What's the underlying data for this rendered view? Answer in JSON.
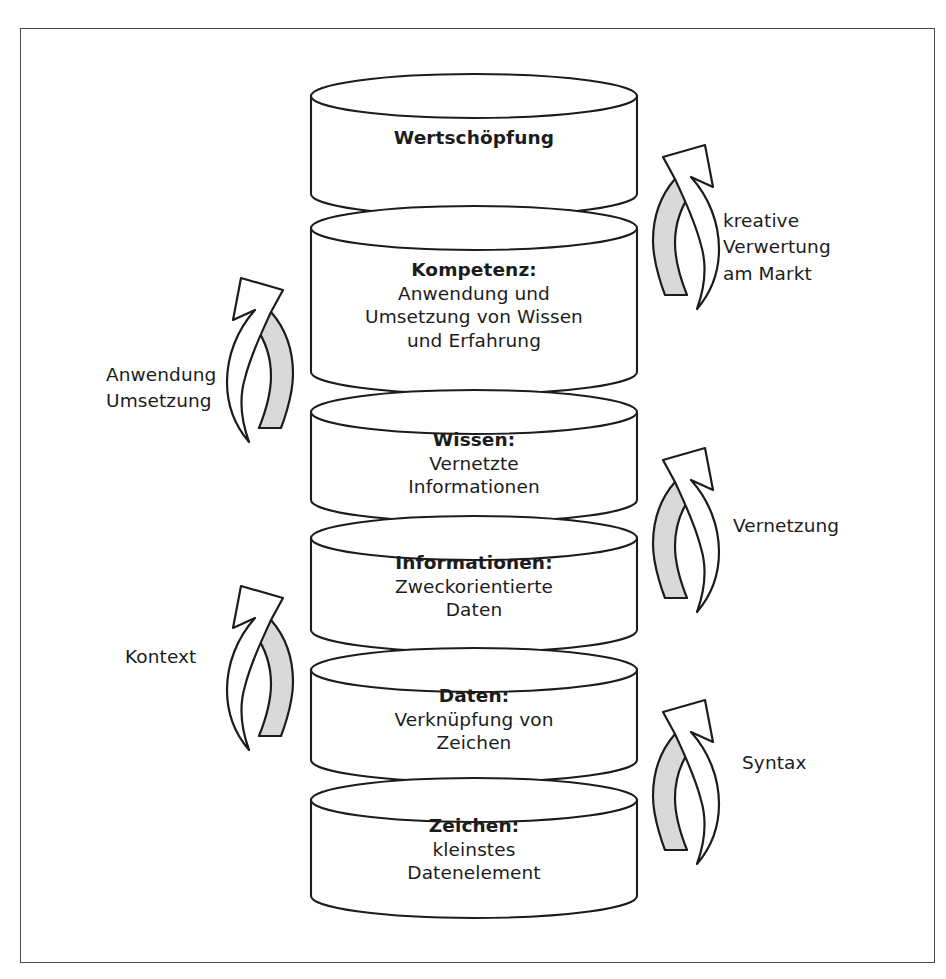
{
  "diagram": {
    "frame_color": "#4a4a4a",
    "arrow_fill": "#d9d9d9",
    "levels": [
      {
        "id": "wertschoepfung",
        "heading": "Wertschöpfung",
        "body": ""
      },
      {
        "id": "kompetenz",
        "heading": "Kompetenz:",
        "body": "Anwendung und\nUmsetzung von Wissen\nund Erfahrung"
      },
      {
        "id": "wissen",
        "heading": "Wissen:",
        "body": "Vernetzte\nInformationen"
      },
      {
        "id": "informationen",
        "heading": "Informationen:",
        "body": "Zweckorientierte\nDaten"
      },
      {
        "id": "daten",
        "heading": "Daten:",
        "body": "Verknüpfung von\nZeichen"
      },
      {
        "id": "zeichen",
        "heading": "Zeichen:",
        "body": "kleinstes\nDatenelement"
      }
    ],
    "transitions": [
      {
        "id": "kreative-verwertung",
        "label": "kreative\nVerwertung\nam Markt",
        "side": "right"
      },
      {
        "id": "anwendung-umsetzung",
        "label": "Anwendung\nUmsetzung",
        "side": "left"
      },
      {
        "id": "vernetzung",
        "label": "Vernetzung",
        "side": "right"
      },
      {
        "id": "kontext",
        "label": "Kontext",
        "side": "left"
      },
      {
        "id": "syntax",
        "label": "Syntax",
        "side": "right"
      }
    ]
  }
}
